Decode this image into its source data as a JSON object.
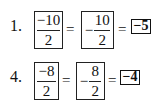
{
  "problems": [
    {
      "number": "1.",
      "left_fraction": {
        "numerator": "−10",
        "denominator": "2"
      },
      "equals_1": "=",
      "middle_sign": "−",
      "middle_fraction": {
        "numerator": "10",
        "denominator": "2"
      },
      "equals_2": "=",
      "answer": "−5"
    },
    {
      "number": "4.",
      "left_fraction": {
        "numerator": "−8",
        "denominator": "2"
      },
      "equals_1": "=",
      "middle_sign": "−",
      "middle_fraction": {
        "numerator": "8",
        "denominator": "2"
      },
      "equals_2": "=",
      "answer": "−4"
    }
  ]
}
